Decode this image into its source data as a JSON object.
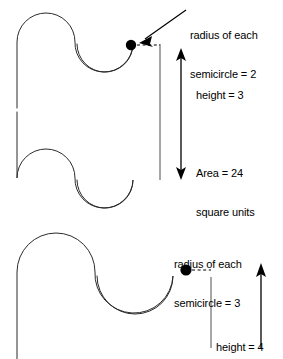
{
  "figure": {
    "background_color": "#ffffff",
    "stroke_color": "#2b2b2b",
    "text_color": "#000000",
    "diagrams": [
      {
        "id": "top-diagram",
        "radius_label_line1": "radius of each",
        "radius_label_line2": "semicircle = 2",
        "radius_value": "2",
        "height_label": "height = 3",
        "height_value": "3",
        "area_label_line1": "Area = 24",
        "area_label_line2": "square units",
        "area_value": "24",
        "area_units": "square units",
        "dimension_arrow": "double-headed-vertical",
        "callout_arrow": "diagonal-pointing-down-left"
      },
      {
        "id": "bottom-diagram",
        "radius_label_line1": "radius of each",
        "radius_label_line2": "semicircle = 3",
        "radius_value": "3",
        "height_label": "height = 4",
        "height_value": "4",
        "dimension_arrow": "single-headed-vertical-up"
      }
    ]
  },
  "labels": {
    "top_radius_line1": "radius of each",
    "top_radius_line2": "semicircle = 2",
    "top_height": "height = 3",
    "top_area_line1": "Area = 24",
    "top_area_line2": "square units",
    "bottom_radius_line1": "radius of each",
    "bottom_radius_line2": "semicircle = 3",
    "bottom_height": "height = 4"
  }
}
